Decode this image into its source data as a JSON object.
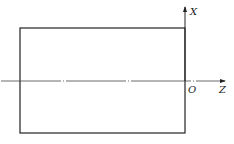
{
  "diagram": {
    "type": "coordinate-system-with-rectangle",
    "axes": {
      "x_label": "X",
      "z_label": "Z",
      "origin_label": "O"
    },
    "colors": {
      "line": "#222222",
      "background": "#ffffff"
    }
  }
}
